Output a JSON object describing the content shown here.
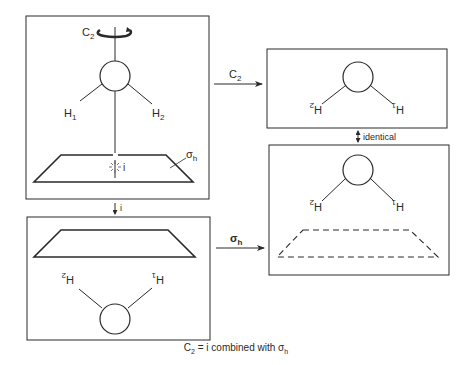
{
  "diagram": {
    "caption": {
      "lhs": "C",
      "lhs_sub": "2",
      "middle": " = i combined with ",
      "rhs": "σ",
      "rhs_sub": "h"
    },
    "panels": [
      {
        "id": "original",
        "position": "top-left",
        "labels": {
          "axis": "C",
          "axis_sub": "2",
          "h1": "H",
          "h1_sub": "1",
          "h2": "H",
          "h2_sub": "2",
          "inversion_center": "i",
          "plane": "σ",
          "plane_sub": "h"
        },
        "plane_style": "solid"
      },
      {
        "id": "after-c2",
        "position": "top-right",
        "labels": {
          "left_h": "H",
          "left_h_sub": "2",
          "right_h": "H",
          "right_h_sub": "1"
        },
        "note": "H labels rotated 180°"
      },
      {
        "id": "after-sigma-h",
        "position": "bottom-right",
        "labels": {
          "left_h": "H",
          "left_h_sub": "2",
          "right_h": "H",
          "right_h_sub": "1"
        },
        "plane_style": "dashed"
      },
      {
        "id": "after-i",
        "position": "bottom-left",
        "labels": {
          "left_h": "H",
          "left_h_sub": "2",
          "right_h": "H",
          "right_h_sub": "1"
        },
        "plane_style": "solid",
        "note": "molecule inverted below plane"
      }
    ],
    "arrows": [
      {
        "from": "original",
        "to": "after-c2",
        "label": "C",
        "label_sub": "2"
      },
      {
        "from": "original",
        "to": "after-i",
        "label": "i"
      },
      {
        "from": "after-i",
        "to": "after-sigma-h",
        "label": "σ",
        "label_sub": "h"
      },
      {
        "from": "after-c2",
        "to": "after-sigma-h",
        "label": "identical",
        "bidirectional": true
      }
    ],
    "colors": {
      "ink": "#2a2a2a",
      "background": "#ffffff"
    }
  }
}
